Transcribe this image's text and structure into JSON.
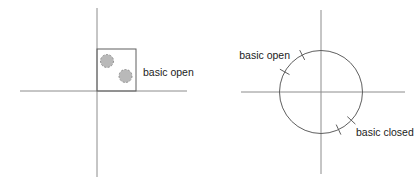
{
  "canvas": {
    "width": 419,
    "height": 184,
    "background": "#ffffff"
  },
  "colors": {
    "background": "#ffffff",
    "axis": "#8c8c8c",
    "outline": "#5f5f5f",
    "dot_fill": "#b9b9b9",
    "dot_stroke": "#8f8f8f",
    "text": "#1c1c1c"
  },
  "left_diagram": {
    "label": "basic open"
  },
  "right_diagram": {
    "label_open": "basic open",
    "label_closed": "basic closed"
  }
}
